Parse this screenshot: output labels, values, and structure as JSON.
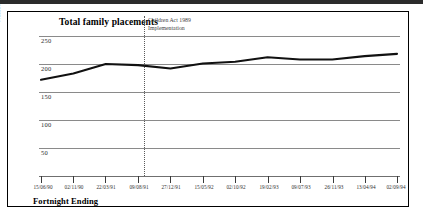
{
  "figure": {
    "title": "Total family placements",
    "xaxis_title": "Fortnight Ending",
    "yaxis_title": "Number of Children (12 week moving average)",
    "annotation": {
      "line1": "Children Act 1989",
      "line2": "Implementation"
    }
  },
  "chart_data": {
    "type": "line",
    "title": "Total family placements",
    "xlabel": "Fortnight Ending",
    "ylabel": "Number of Children (12 week moving average)",
    "ylim": [
      0,
      270
    ],
    "yticks": [
      50,
      100,
      150,
      200,
      250
    ],
    "grid": true,
    "legend": null,
    "xtick_labels": [
      "15/06/90",
      "02/11/90",
      "22/03/91",
      "09/08/91",
      "27/12/91",
      "15/05/92",
      "02/10/92",
      "19/02/93",
      "09/07/93",
      "26/11/93",
      "13/04/94",
      "02/09/94"
    ],
    "annotations": [
      {
        "text": "Children Act 1989 Implementation",
        "x": "09/08/91",
        "style": "vertical dotted line"
      }
    ],
    "series": [
      {
        "name": "Total family placements",
        "color": "#111111",
        "x": [
          "15/06/90",
          "02/11/90",
          "22/03/91",
          "09/08/91",
          "27/12/91",
          "15/05/92",
          "02/10/92",
          "19/02/93",
          "09/07/93",
          "26/11/93",
          "13/04/94",
          "02/09/94"
        ],
        "values": [
          172,
          183,
          200,
          198,
          192,
          201,
          204,
          212,
          208,
          208,
          214,
          218
        ]
      }
    ]
  },
  "colors": {
    "line": "#111111",
    "grid": "#8a8a8a",
    "event_marker": "#5a5a5a",
    "frame": "#000000"
  }
}
